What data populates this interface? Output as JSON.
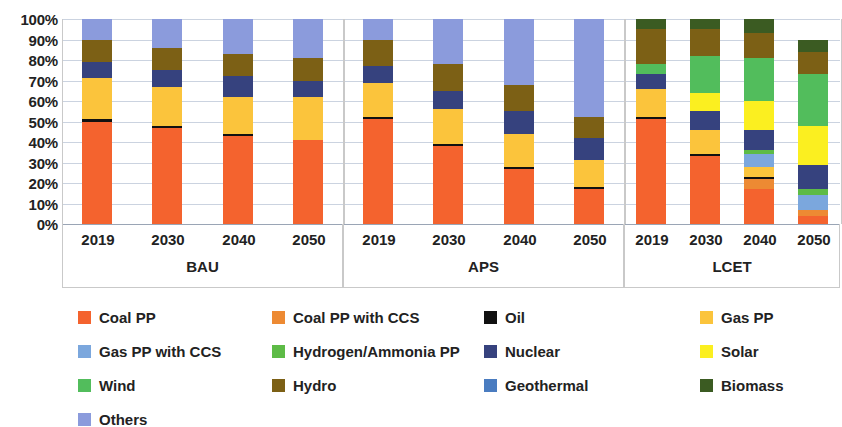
{
  "chart_data": {
    "type": "bar",
    "subtype": "stacked-100-percent",
    "title": "",
    "xlabel": "",
    "ylabel": "",
    "ylim": [
      0,
      100
    ],
    "ytick_labels": [
      "0%",
      "10%",
      "20%",
      "30%",
      "40%",
      "50%",
      "60%",
      "70%",
      "80%",
      "90%",
      "100%"
    ],
    "ytick_values": [
      0,
      10,
      20,
      30,
      40,
      50,
      60,
      70,
      80,
      90,
      100
    ],
    "grid": true,
    "legend_position": "bottom",
    "groups": [
      {
        "name": "BAU",
        "categories": [
          "2019",
          "2030",
          "2040",
          "2050"
        ]
      },
      {
        "name": "APS",
        "categories": [
          "2019",
          "2030",
          "2040",
          "2050"
        ]
      },
      {
        "name": "LCET",
        "categories": [
          "2019",
          "2030",
          "2040",
          "2050"
        ]
      }
    ],
    "categories": [
      "2019",
      "2030",
      "2040",
      "2050"
    ],
    "series": [
      {
        "name": "Coal PP",
        "color": "#F4632E",
        "values": {
          "BAU": [
            50,
            47,
            43,
            41
          ],
          "APS": [
            51,
            38,
            27,
            17
          ],
          "LCET": [
            51,
            33,
            17,
            4
          ]
        }
      },
      {
        "name": "Coal PP with CCS",
        "color": "#ED8A33",
        "values": {
          "BAU": [
            0,
            0,
            0,
            0
          ],
          "APS": [
            0,
            0,
            0,
            0
          ],
          "LCET": [
            0,
            0,
            5,
            3
          ]
        }
      },
      {
        "name": "Oil",
        "color": "#111111",
        "values": {
          "BAU": [
            1,
            1,
            1,
            0
          ],
          "APS": [
            1,
            1,
            1,
            1
          ],
          "LCET": [
            1,
            1,
            1,
            0
          ]
        }
      },
      {
        "name": "Gas PP",
        "color": "#FBC43C",
        "values": {
          "BAU": [
            20,
            19,
            18,
            21
          ],
          "APS": [
            17,
            17,
            16,
            13
          ],
          "LCET": [
            14,
            12,
            5,
            0
          ]
        }
      },
      {
        "name": "Gas PP with CCS",
        "color": "#7BA7DD",
        "values": {
          "BAU": [
            0,
            0,
            0,
            0
          ],
          "APS": [
            0,
            0,
            0,
            0
          ],
          "LCET": [
            0,
            0,
            6,
            7
          ]
        }
      },
      {
        "name": "Hydrogen/Ammonia PP",
        "color": "#5DBB46",
        "values": {
          "BAU": [
            0,
            0,
            0,
            0
          ],
          "APS": [
            0,
            0,
            0,
            0
          ],
          "LCET": [
            0,
            0,
            2,
            3
          ]
        }
      },
      {
        "name": "Nuclear",
        "color": "#36427E",
        "values": {
          "BAU": [
            8,
            8,
            10,
            8
          ],
          "APS": [
            8,
            9,
            11,
            11
          ],
          "LCET": [
            7,
            9,
            10,
            12
          ]
        }
      },
      {
        "name": "Solar",
        "color": "#FBEF20",
        "values": {
          "BAU": [
            0,
            0,
            0,
            0
          ],
          "APS": [
            0,
            0,
            0,
            0
          ],
          "LCET": [
            0,
            9,
            14,
            19
          ]
        }
      },
      {
        "name": "Wind",
        "color": "#52BD5C",
        "values": {
          "BAU": [
            0,
            0,
            0,
            0
          ],
          "APS": [
            0,
            0,
            0,
            0
          ],
          "LCET": [
            5,
            18,
            21,
            25
          ]
        }
      },
      {
        "name": "Hydro",
        "color": "#7C6015",
        "values": {
          "BAU": [
            11,
            11,
            11,
            11
          ],
          "APS": [
            13,
            13,
            13,
            10
          ],
          "LCET": [
            17,
            13,
            12,
            11
          ]
        }
      },
      {
        "name": "Geothermal",
        "color": "#4A7CC0",
        "values": {
          "BAU": [
            0,
            0,
            0,
            0
          ],
          "APS": [
            0,
            0,
            0,
            0
          ],
          "LCET": [
            0,
            0,
            0,
            0
          ]
        }
      },
      {
        "name": "Biomass",
        "color": "#3B5B22",
        "values": {
          "BAU": [
            0,
            0,
            0,
            0
          ],
          "APS": [
            0,
            0,
            0,
            0
          ],
          "LCET": [
            5,
            5,
            7,
            6
          ]
        }
      },
      {
        "name": "Others",
        "color": "#8B9BDC",
        "values": {
          "BAU": [
            10,
            14,
            17,
            19
          ],
          "APS": [
            10,
            22,
            32,
            48
          ],
          "LCET": [
            0,
            0,
            0,
            0
          ]
        }
      }
    ]
  },
  "legend": {
    "items": [
      {
        "label": "Coal PP",
        "color": "#F4632E"
      },
      {
        "label": "Coal PP with CCS",
        "color": "#ED8A33"
      },
      {
        "label": "Oil",
        "color": "#111111"
      },
      {
        "label": "Gas PP",
        "color": "#FBC43C"
      },
      {
        "label": "Gas PP with CCS",
        "color": "#7BA7DD"
      },
      {
        "label": "Hydrogen/Ammonia PP",
        "color": "#5DBB46"
      },
      {
        "label": "Nuclear",
        "color": "#36427E"
      },
      {
        "label": "Solar",
        "color": "#FBEF20"
      },
      {
        "label": "Wind",
        "color": "#52BD5C"
      },
      {
        "label": "Hydro",
        "color": "#7C6015"
      },
      {
        "label": "Geothermal",
        "color": "#4A7CC0"
      },
      {
        "label": "Biomass",
        "color": "#3B5B22"
      },
      {
        "label": "Others",
        "color": "#8B9BDC"
      }
    ]
  }
}
